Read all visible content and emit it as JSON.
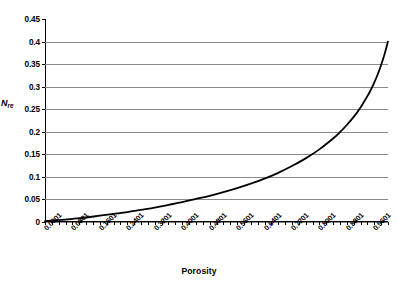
{
  "chart_data": {
    "type": "line",
    "title": "",
    "xlabel": "Porosity",
    "ylabel": "N_re",
    "ylabel_base": "N",
    "ylabel_sub": "re",
    "xlim": [
      0.0001,
      1.0001
    ],
    "ylim": [
      0,
      0.45
    ],
    "grid": true,
    "legend": "none",
    "y_ticks": [
      "0.45",
      "0.4",
      "0.35",
      "0.3",
      "0.25",
      "0.2",
      "0.15",
      "0.1",
      "0.05",
      "0"
    ],
    "y_tick_values": [
      0.45,
      0.4,
      0.35,
      0.3,
      0.25,
      0.2,
      0.15,
      0.1,
      0.05,
      0
    ],
    "x_tick_labels": [
      "0.0001",
      "0.0801",
      "0.1601",
      "0.2401",
      "0.3201",
      "0.4001",
      "0.4801",
      "0.5601",
      "0.6401",
      "0.7201",
      "0.8001",
      "0.8801",
      "0.9601"
    ],
    "x_tick_values": [
      0.0001,
      0.0801,
      0.1601,
      0.2401,
      0.3201,
      0.4001,
      0.4801,
      0.5601,
      0.6401,
      0.7201,
      0.8001,
      0.8801,
      0.9601
    ],
    "x_minor_step": 0.02,
    "line_color": "#000000",
    "line_width": 1.8,
    "grid_color": "#8a8a8a",
    "series": [
      {
        "name": "N_re vs Porosity",
        "x": [
          0.0001,
          0.04,
          0.08,
          0.12,
          0.16,
          0.2,
          0.24,
          0.28,
          0.32,
          0.36,
          0.4,
          0.44,
          0.48,
          0.52,
          0.56,
          0.6,
          0.64,
          0.68,
          0.72,
          0.76,
          0.8,
          0.84,
          0.86,
          0.88,
          0.9,
          0.92,
          0.94,
          0.95,
          0.96,
          0.97,
          0.98,
          0.99,
          1.0
        ],
        "y": [
          0.002,
          0.004,
          0.007,
          0.01,
          0.014,
          0.018,
          0.022,
          0.027,
          0.032,
          0.038,
          0.044,
          0.051,
          0.058,
          0.066,
          0.075,
          0.085,
          0.096,
          0.109,
          0.124,
          0.141,
          0.161,
          0.185,
          0.199,
          0.215,
          0.233,
          0.254,
          0.279,
          0.293,
          0.309,
          0.327,
          0.348,
          0.372,
          0.4
        ]
      }
    ]
  }
}
